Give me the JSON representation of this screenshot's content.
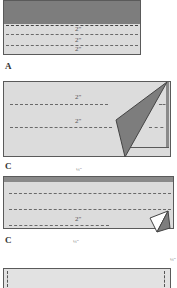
{
  "colors": {
    "fabric_light": "#dcdcdc",
    "fabric_dark": "#7d7d7d",
    "outline": "#5a5a5a",
    "dash": "#6a6a6a",
    "background": "#ffffff"
  },
  "steps": [
    {
      "id": "A",
      "label": "A",
      "measurements": [
        "2\"",
        "2\"",
        "2\""
      ],
      "description": "Folded band with dark top section and three dashed fold lines"
    },
    {
      "id": "B",
      "label": "B",
      "measurements": [
        "2\"",
        "2\""
      ],
      "description": "Light rectangle with dark triangular corner fold on right"
    },
    {
      "id": "C",
      "label": "C",
      "top_fraction": "¼\"",
      "measurements": [
        "2\""
      ],
      "description": "Long strip with dark top edge, three dashed lines and small corner fold"
    },
    {
      "id": "D",
      "top_fraction": "¼\"",
      "bottom_fraction": "¼\"",
      "description": "Strip with short vertical dashed lines at both ends"
    }
  ]
}
